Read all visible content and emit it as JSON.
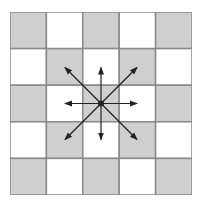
{
  "diagram": {
    "rows": 5,
    "cols": 5,
    "colors": {
      "dark_cell": "#cfcfcf",
      "light_cell": "#ffffff",
      "grid_line": "#8a8a8a",
      "arrow": "#222222"
    },
    "center": {
      "row": 2,
      "col": 2
    },
    "directions": [
      "N",
      "NE",
      "E",
      "SE",
      "S",
      "SW",
      "W",
      "NW"
    ]
  }
}
